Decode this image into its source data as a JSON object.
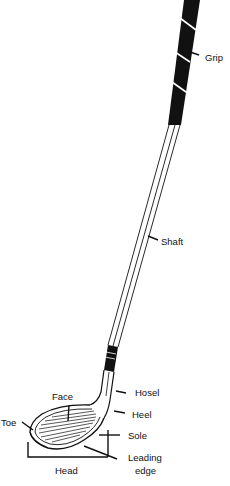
{
  "diagram": {
    "colors": {
      "ink": "#111111",
      "background": "#ffffff"
    },
    "labels": {
      "grip": "Grip",
      "shaft": "Shaft",
      "hosel": "Hosel",
      "heel": "Heel",
      "face": "Face",
      "toe": "Toe",
      "sole": "Sole",
      "leading_edge_line1": "Leading",
      "leading_edge_line2": "edge",
      "head": "Head"
    }
  }
}
